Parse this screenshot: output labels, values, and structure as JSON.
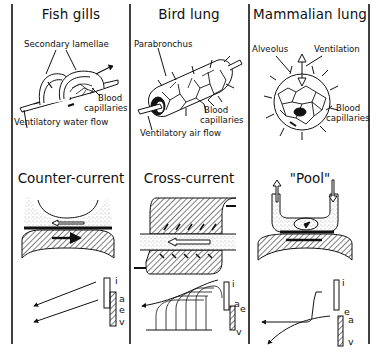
{
  "columns": [
    {
      "title": "Fish gills",
      "labels": {
        "top": "Secondary lamellae",
        "right_1": "Blood",
        "right_2": "capillaries",
        "bottom": "Ventilatory water flow"
      },
      "mode": "Counter-current",
      "graph_labels": [
        "i",
        "a",
        "e",
        "v"
      ]
    },
    {
      "title": "Bird lung",
      "labels": {
        "top": "Parabronchus",
        "right_1": "Blood",
        "right_2": "capillaries",
        "bottom": "Ventilatory air flow"
      },
      "mode": "Cross-current",
      "graph_labels": [
        "i",
        "a",
        "e",
        "v"
      ]
    },
    {
      "title": "Mammalian lung",
      "labels": {
        "top_left": "Alveolus",
        "top_right": "Ventilation",
        "right_1": "Blood",
        "right_2": "capillaries"
      },
      "mode": "\"Pool\"",
      "graph_labels": [
        "i",
        "e",
        "a",
        "v"
      ]
    }
  ],
  "colors": {
    "ink": "#111111",
    "stipple": "#d8d8d8",
    "paper": "#ffffff"
  }
}
